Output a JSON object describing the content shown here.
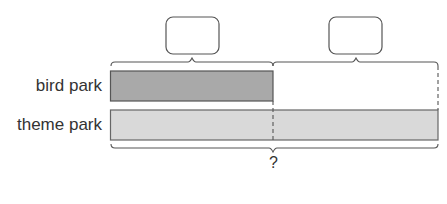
{
  "diagram": {
    "type": "bar-model",
    "rows": [
      {
        "label": "bird park",
        "color": "#a9a9a9"
      },
      {
        "label": "theme park",
        "color": "#d9d9d9"
      }
    ],
    "answer_boxes": [
      "",
      ""
    ],
    "total_label": "?"
  }
}
